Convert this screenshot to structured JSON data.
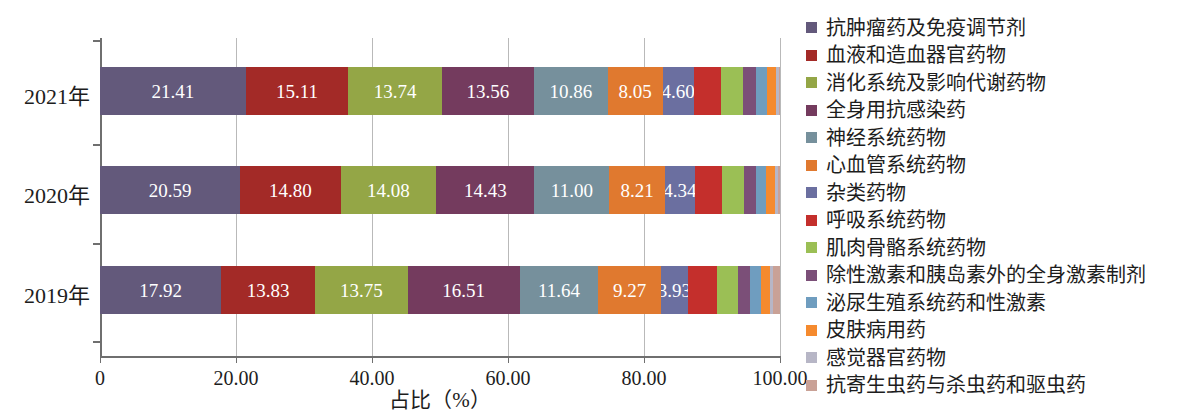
{
  "chart_data": {
    "type": "bar",
    "orientation": "horizontal",
    "stacked": true,
    "title": "",
    "xlabel": "占比（%）",
    "ylabel": "",
    "xlim": [
      0,
      100
    ],
    "grid": true,
    "legend_position": "right",
    "categories": [
      "2021年",
      "2020年",
      "2019年"
    ],
    "xticklabels": [
      "0",
      "20.00",
      "40.00",
      "60.00",
      "80.00",
      "100.00"
    ],
    "xtickvalues": [
      0,
      20,
      40,
      60,
      80,
      100
    ],
    "series": [
      {
        "name": "抗肿瘤药及免疫调节剂",
        "color": "#63597b",
        "values": [
          21.41,
          20.59,
          17.92
        ],
        "labeled": true
      },
      {
        "name": "血液和造血器官药物",
        "color": "#a32a27",
        "values": [
          15.11,
          14.8,
          13.83
        ],
        "labeled": true
      },
      {
        "name": "消化系统及影响代谢药物",
        "color": "#94a646",
        "values": [
          13.74,
          14.08,
          13.75
        ],
        "labeled": true
      },
      {
        "name": "全身用抗感染药",
        "color": "#743b5e",
        "values": [
          13.56,
          14.43,
          16.51
        ],
        "labeled": true
      },
      {
        "name": "神经系统药物",
        "color": "#76909c",
        "values": [
          10.86,
          11.0,
          11.64
        ],
        "labeled": true
      },
      {
        "name": "心血管系统药物",
        "color": "#e0792f",
        "values": [
          8.05,
          8.21,
          9.27
        ],
        "labeled": true
      },
      {
        "name": "杂类药物",
        "color": "#6b6fa0",
        "values": [
          4.6,
          4.34,
          3.93
        ],
        "labeled": true
      },
      {
        "name": "呼吸系统药物",
        "color": "#c42f2c",
        "values": [
          4.05,
          4.1,
          4.4
        ],
        "labeled": false
      },
      {
        "name": "肌肉骨骼系统药物",
        "color": "#9bbf55",
        "values": [
          3.2,
          3.1,
          3.05
        ],
        "labeled": false
      },
      {
        "name": "除性激素和胰岛素外的全身激素制剂",
        "color": "#7b4f78",
        "values": [
          1.9,
          1.85,
          1.8
        ],
        "labeled": false
      },
      {
        "name": "泌尿生殖系统药和性激素",
        "color": "#6f9dbf",
        "values": [
          1.55,
          1.5,
          1.6
        ],
        "labeled": false
      },
      {
        "name": "皮肤病用药",
        "color": "#f58a2e",
        "values": [
          1.35,
          1.3,
          1.35
        ],
        "labeled": false
      },
      {
        "name": "感觉器官药物",
        "color": "#b7b6c6",
        "values": [
          0.45,
          0.45,
          0.5
        ],
        "labeled": false
      },
      {
        "name": "抗寄生虫药与杀虫药和驱虫药",
        "color": "#c9a196",
        "values": [
          0.17,
          0.25,
          0.95
        ],
        "labeled": false
      }
    ]
  },
  "axis": {
    "title_x": "占比（%）"
  }
}
